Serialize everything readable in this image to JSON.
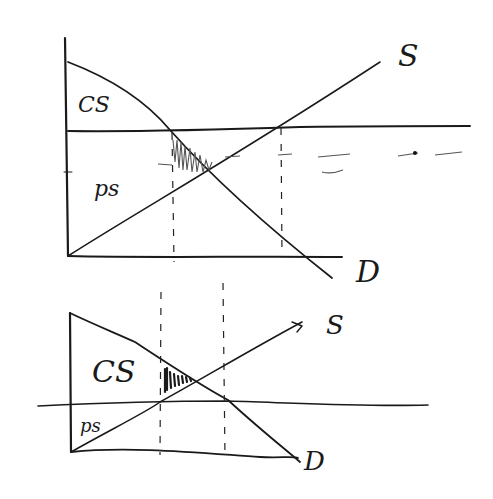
{
  "diagram": {
    "top_graph": {
      "supply_label": "S",
      "demand_label": "D",
      "consumer_surplus_label": "CS",
      "producer_surplus_label": "ps"
    },
    "bottom_graph": {
      "supply_label": "S",
      "demand_label": "D",
      "consumer_surplus_label": "CS",
      "producer_surplus_label": "ps"
    },
    "colors": {
      "ink": "#1a1a1a",
      "background": "#ffffff"
    }
  }
}
